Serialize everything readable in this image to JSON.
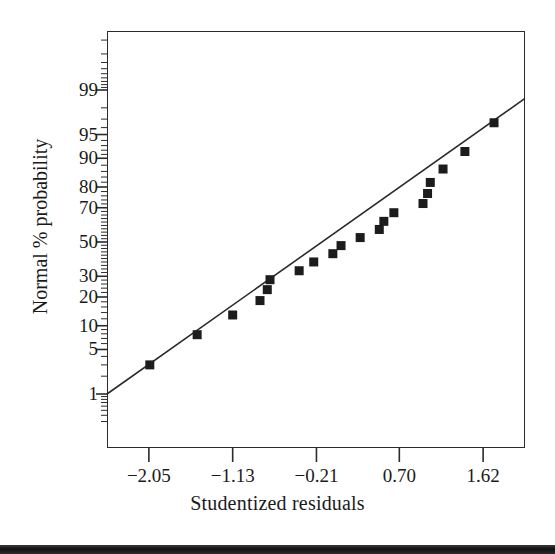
{
  "chart_data": {
    "type": "scatter",
    "title": "",
    "subtitle": "",
    "xlabel": "Studentized residuals",
    "ylabel": "Normal % probability",
    "grid": false,
    "legend": null,
    "xlim": [
      -2.51,
      2.08
    ],
    "ylim_percent": [
      0.2,
      99.9
    ],
    "y_scale": "normal-probability",
    "x_tick_labels": [
      "−2.05",
      "−1.13",
      "−0.21",
      "0.70",
      "1.62"
    ],
    "x_tick_values": [
      -2.05,
      -1.13,
      -0.21,
      0.7,
      1.62
    ],
    "y_tick_labels": [
      "99",
      "95",
      "90",
      "80",
      "70",
      "50",
      "30",
      "20",
      "10",
      "5",
      "1"
    ],
    "y_tick_values": [
      99,
      95,
      90,
      80,
      70,
      50,
      30,
      20,
      10,
      5,
      1
    ],
    "y_minor_ticks": [
      0.5,
      2,
      3,
      40,
      60,
      98,
      99.5
    ],
    "marker": "square",
    "marker_color": "#1c1c1c",
    "line_color": "#2b2b2b",
    "reference_line": {
      "label": "normal reference line",
      "x_start": -2.51,
      "y_start_percent": 1.0,
      "x_end": 2.08,
      "y_end_percent": 98.6
    },
    "points": [
      {
        "x": -2.04,
        "y": 3.0
      },
      {
        "x": -1.52,
        "y": 7.8
      },
      {
        "x": -1.13,
        "y": 13.2
      },
      {
        "x": -0.83,
        "y": 18.5
      },
      {
        "x": -0.75,
        "y": 23.3
      },
      {
        "x": -0.72,
        "y": 28.2
      },
      {
        "x": -0.4,
        "y": 33.0
      },
      {
        "x": -0.24,
        "y": 38.0
      },
      {
        "x": -0.03,
        "y": 42.9
      },
      {
        "x": 0.06,
        "y": 47.8
      },
      {
        "x": 0.27,
        "y": 52.7
      },
      {
        "x": 0.48,
        "y": 57.6
      },
      {
        "x": 0.53,
        "y": 62.4
      },
      {
        "x": 0.64,
        "y": 67.3
      },
      {
        "x": 0.96,
        "y": 72.2
      },
      {
        "x": 1.01,
        "y": 77.1
      },
      {
        "x": 1.04,
        "y": 81.9
      },
      {
        "x": 1.18,
        "y": 86.8
      },
      {
        "x": 1.42,
        "y": 91.7
      },
      {
        "x": 1.74,
        "y": 96.6
      }
    ]
  },
  "figure": {
    "caption": "",
    "page_edge_label": "page-edge-strip"
  }
}
